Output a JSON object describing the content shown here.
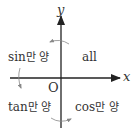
{
  "diagram": {
    "axes": {
      "x_label": "x",
      "y_label": "y",
      "origin_label": "O"
    },
    "quadrants": [
      {
        "position": "second",
        "func": "sin",
        "suffix": "만 양"
      },
      {
        "position": "first",
        "func": "all",
        "suffix": ""
      },
      {
        "position": "third",
        "func": "tan",
        "suffix": "만 양"
      },
      {
        "position": "fourth",
        "func": "cos",
        "suffix": "만 양"
      }
    ],
    "colors": {
      "axis": "#222222",
      "text": "#333333",
      "arc": "#888888"
    }
  }
}
